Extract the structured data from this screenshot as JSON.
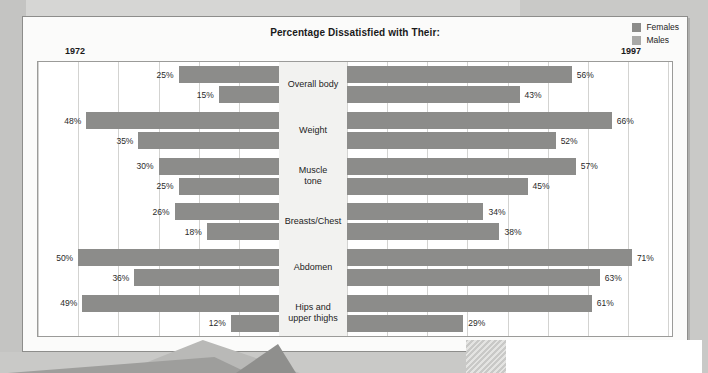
{
  "page": {
    "title": "Percentage Dissatisfied with Their:",
    "year_left": "1972",
    "year_right": "1997"
  },
  "legend": {
    "females_label": "Females",
    "males_label": "Males",
    "females_color": "#8c8c8a",
    "males_color": "#a9a9a7"
  },
  "chart_data": {
    "type": "bar",
    "title": "Percentage Dissatisfied with Their:",
    "subtype": "butterfly/tornado diverging bar",
    "xlabel": "",
    "ylabel": "",
    "xlim": [
      0,
      80
    ],
    "grid": true,
    "legend_position": "top-right",
    "panels": [
      {
        "name": "1972",
        "side": "left",
        "axis_max": 60,
        "gridline_step": 10
      },
      {
        "name": "1997",
        "side": "right",
        "axis_max": 80,
        "gridline_step": 10
      }
    ],
    "categories": [
      "Overall body",
      "Weight",
      "Muscle tone",
      "Breasts/Chest",
      "Abdomen",
      "Hips and upper thighs"
    ],
    "series": [
      {
        "name": "Females",
        "panel": "1972",
        "values": [
          25,
          48,
          30,
          26,
          50,
          49
        ],
        "labels": [
          "25%",
          "48%",
          "30%",
          "26%",
          "50%",
          "49%"
        ]
      },
      {
        "name": "Males",
        "panel": "1972",
        "values": [
          15,
          35,
          25,
          18,
          36,
          12
        ],
        "labels": [
          "15%",
          "35%",
          "25%",
          "18%",
          "36%",
          "12%"
        ]
      },
      {
        "name": "Females",
        "panel": "1997",
        "values": [
          56,
          66,
          57,
          34,
          71,
          61
        ],
        "labels": [
          "56%",
          "66%",
          "57%",
          "34%",
          "71%",
          "61%"
        ]
      },
      {
        "name": "Males",
        "panel": "1997",
        "values": [
          43,
          52,
          45,
          38,
          63,
          29
        ],
        "labels": [
          "43%",
          "52%",
          "45%",
          "38%",
          "63%",
          "29%"
        ]
      }
    ]
  }
}
